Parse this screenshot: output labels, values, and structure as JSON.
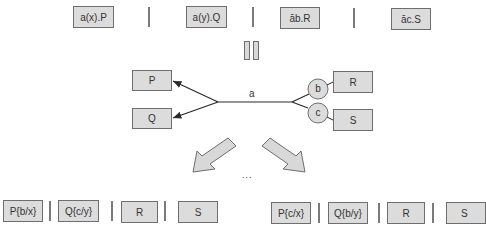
{
  "top_row": {
    "processes": [
      "a(x).P",
      "a(y).Q",
      "āb.R",
      "āc.S"
    ]
  },
  "equivalence_symbol": "parallel-bars",
  "middle": {
    "left_boxes": [
      "P",
      "Q"
    ],
    "right_boxes": [
      "R",
      "S"
    ],
    "channel_label": "a",
    "circles": [
      "b",
      "c"
    ]
  },
  "ellipsis": "...",
  "bottom_left": {
    "processes": [
      "P{b/x}",
      "Q{c/y}",
      "R",
      "S"
    ]
  },
  "bottom_right": {
    "processes": [
      "P{c/x}",
      "Q{b/y}",
      "R",
      "S"
    ]
  },
  "colors": {
    "box_fill": "#dcdcdc",
    "box_border": "#6e6e6e",
    "line": "#2a2a2a"
  }
}
